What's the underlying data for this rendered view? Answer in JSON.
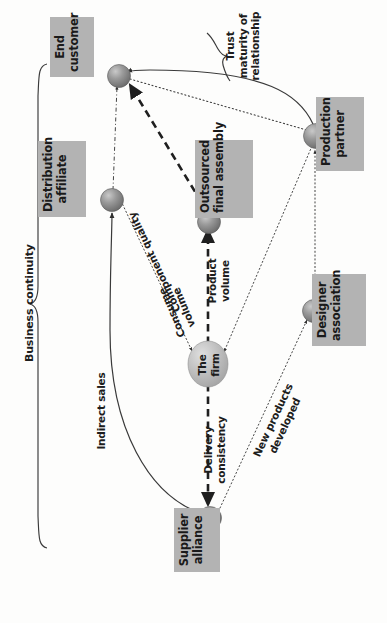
{
  "diagram": {
    "orientation": "rotated-90-ccw",
    "colors": {
      "label_box_fill": "#b3b3b3",
      "node_fill": "#8c8c8c",
      "node_light_fill": "#b9b9b9",
      "line": "#3a3a3a",
      "text": "#1d1d1d",
      "background": "#fdfdfc"
    },
    "nodes": [
      {
        "id": "end-customer",
        "label_lines": [
          "End",
          "customer"
        ]
      },
      {
        "id": "distribution-affiliate",
        "label_lines": [
          "Distribution",
          "affiliate"
        ]
      },
      {
        "id": "outsourced-final-assembly",
        "label_lines": [
          "Outsourced",
          "final assembly"
        ]
      },
      {
        "id": "production-partner",
        "label_lines": [
          "Production",
          "partner"
        ]
      },
      {
        "id": "designer-association",
        "label_lines": [
          "Designer",
          "association"
        ]
      },
      {
        "id": "supplier-alliance",
        "label_lines": [
          "Supplier",
          "alliance"
        ]
      },
      {
        "id": "the-firm",
        "label_lines": [
          "The",
          "firm"
        ]
      }
    ],
    "edge_labels": [
      {
        "id": "trust-maturity",
        "lines": [
          "Trust",
          "maturity of",
          "relationship"
        ]
      },
      {
        "id": "component-quality",
        "lines": [
          "Component quality"
        ]
      },
      {
        "id": "consume-volume",
        "lines": [
          "Consume",
          "volume"
        ]
      },
      {
        "id": "product-volume",
        "lines": [
          "Product",
          "volume"
        ]
      },
      {
        "id": "delivery-consistency",
        "lines": [
          "Delivery",
          "consistency"
        ]
      },
      {
        "id": "new-products-developed",
        "lines": [
          "New products",
          "developed"
        ]
      },
      {
        "id": "indirect-sales",
        "lines": [
          "Indirect sales"
        ]
      },
      {
        "id": "business-continuity",
        "lines": [
          "Business continuity"
        ]
      }
    ]
  }
}
